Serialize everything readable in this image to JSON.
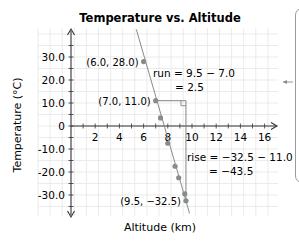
{
  "chart_data": {
    "type": "scatter",
    "title": "Temperature vs. Altitude",
    "xlabel": "Altitude (km)",
    "ylabel": "Temperature (°C)",
    "xlim": [
      0,
      17
    ],
    "ylim": [
      -40,
      40
    ],
    "x_ticks": [
      2,
      4,
      6,
      8,
      10,
      12,
      14,
      16
    ],
    "x_tick_labels": [
      "2",
      "4",
      "6",
      "8",
      "10",
      "12",
      "14",
      "16"
    ],
    "y_ticks": [
      30,
      20,
      10,
      0,
      -10,
      -20,
      -30
    ],
    "y_tick_labels": [
      "30.0",
      "20.0",
      "10.0",
      "0",
      "-10.0",
      "-20.0",
      "-30.0"
    ],
    "grid": true,
    "series": [
      {
        "name": "Measurements",
        "points": [
          {
            "x": 6.0,
            "y": 28.0
          },
          {
            "x": 7.0,
            "y": 11.0
          },
          {
            "x": 7.4,
            "y": 3.5
          },
          {
            "x": 8.0,
            "y": -7.5
          },
          {
            "x": 8.6,
            "y": -17.5
          },
          {
            "x": 8.9,
            "y": -22.5
          },
          {
            "x": 9.4,
            "y": -29.5
          },
          {
            "x": 9.5,
            "y": -32.5
          }
        ]
      }
    ],
    "trend_line": {
      "x1": 5.4,
      "y1": 42.0,
      "x2": 9.8,
      "y2": -38.0
    },
    "labeled_points": [
      {
        "label": "(6.0, 28.0)",
        "x": 6.0,
        "y": 28.0
      },
      {
        "label": "(7.0, 11.0)",
        "x": 7.0,
        "y": 11.0
      },
      {
        "label": "(9.5, −32.5)",
        "x": 9.5,
        "y": -32.5
      }
    ],
    "annotations": {
      "run_line1": "run = 9.5 − 7.0",
      "run_line2": "= 2.5",
      "rise_line1": "rise = −32.5 − 11.0",
      "rise_line2": "= −43.5"
    }
  },
  "colors": {
    "grid": "#e6e6e6",
    "axis": "#333333",
    "point": "#8a8a8a",
    "line": "#8a8a8a",
    "text": "#1a1a1a"
  }
}
